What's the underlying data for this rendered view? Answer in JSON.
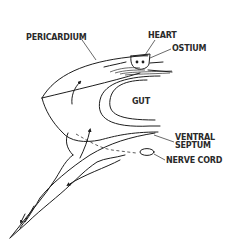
{
  "diagram": {
    "title": "",
    "labels": {
      "pericardium": "PERICARDIUM",
      "heart": "HEART",
      "ostium": "OSTIUM",
      "gut": "GUT",
      "ventral_septum_line1": "VENTRAL",
      "ventral_septum_line2": "SEPTUM",
      "nerve_cord": "NERVE CORD"
    },
    "colors": {
      "line": "#1e1e1e",
      "text": "#2a2a2a",
      "background": "#ffffff"
    }
  }
}
